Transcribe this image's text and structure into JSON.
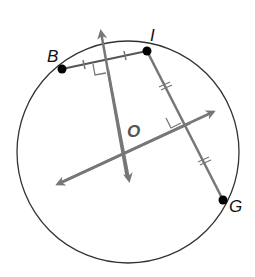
{
  "diagram": {
    "type": "geometry-circle",
    "labels": {
      "B": "B",
      "I": "I",
      "O": "O",
      "G": "G"
    },
    "circle": {
      "cx": 128,
      "cy": 152,
      "r": 111,
      "stroke": "#333333"
    },
    "points": [
      {
        "name": "B",
        "x": 62,
        "y": 69
      },
      {
        "name": "I",
        "x": 147,
        "y": 51
      },
      {
        "name": "G",
        "x": 223,
        "y": 200
      }
    ],
    "chords": [
      {
        "from": "B",
        "to": "I"
      },
      {
        "from": "I",
        "to": "G"
      }
    ],
    "perpendicular_bisectors": [
      {
        "of": "BI",
        "from": [
          99,
          27
        ],
        "to": [
          129,
          183
        ]
      },
      {
        "of": "IG",
        "from": [
          215,
          111
        ],
        "to": [
          55,
          186
        ]
      }
    ],
    "colors": {
      "line": "#777777",
      "circle": "#333333",
      "point": "#000000"
    }
  }
}
